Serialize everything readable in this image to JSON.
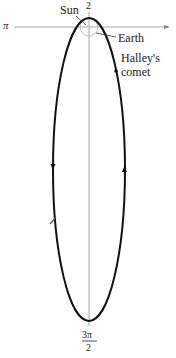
{
  "diagram": {
    "type": "polar orbit diagram",
    "axis_labels": {
      "left": "π",
      "top": "2",
      "bottom_numerator": "3π",
      "bottom_denominator": "2"
    },
    "annotations": {
      "sun": "Sun",
      "earth": "Earth",
      "comet_line1": "Halley's",
      "comet_line2": "comet"
    },
    "colors": {
      "orbit": "#111111",
      "axes": "#aaaaaa",
      "earth_orbit": "#bbbbbb",
      "text": "#1a1a1a"
    }
  }
}
